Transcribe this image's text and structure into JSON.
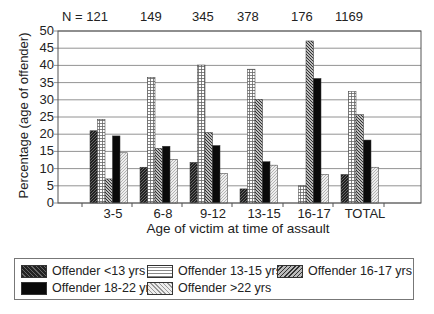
{
  "chart_data": {
    "type": "bar",
    "title": "",
    "xlabel": "Age of victim at time of assault",
    "ylabel": "Percentage (age of offender)",
    "ylim": [
      0,
      50
    ],
    "yticks": [
      0,
      5,
      10,
      15,
      20,
      25,
      30,
      35,
      40,
      45,
      50
    ],
    "grid": true,
    "legend_position": "bottom",
    "categories": [
      "3-5",
      "6-8",
      "9-12",
      "13-15",
      "16-17",
      "TOTAL"
    ],
    "n_labels": [
      "N = 121",
      "149",
      "345",
      "378",
      "176",
      "1169"
    ],
    "series": [
      {
        "name": "Offender <13 yrs",
        "values": [
          21,
          10.4,
          11.8,
          4.1,
          0,
          8.3
        ]
      },
      {
        "name": "Offender 13-15 yrs",
        "values": [
          24.3,
          36.5,
          40.1,
          38.9,
          5,
          32.4
        ]
      },
      {
        "name": "Offender 16-17 yrs",
        "values": [
          7,
          15.9,
          20.5,
          30.1,
          47.1,
          25.7
        ]
      },
      {
        "name": "Offender 18-22 yrs",
        "values": [
          19.5,
          16.5,
          16.7,
          12,
          36.2,
          18.3
        ]
      },
      {
        "name": "Offender >22 yrs",
        "values": [
          14.6,
          12.7,
          8.6,
          11,
          8.3,
          10.4
        ]
      }
    ]
  },
  "legend": {
    "items": [
      "Offender <13 yrs",
      "Offender 13-15 yrs",
      "Offender 16-17 yrs",
      "Offender 18-22 yrs",
      "Offender >22 yrs"
    ]
  }
}
